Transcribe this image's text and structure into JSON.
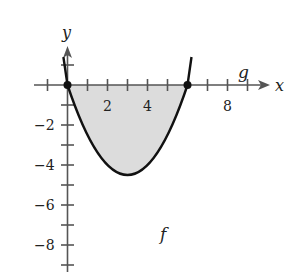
{
  "figure": {
    "axis_labels": {
      "x": "x",
      "y": "y"
    },
    "x_ticks": [
      {
        "value": 2,
        "label": "2"
      },
      {
        "value": 4,
        "label": "4"
      },
      {
        "value": 8,
        "label": "8"
      }
    ],
    "y_ticks": [
      {
        "value": -2,
        "label": "−2"
      },
      {
        "value": -4,
        "label": "−4"
      },
      {
        "value": -6,
        "label": "−6"
      },
      {
        "value": -8,
        "label": "−8"
      }
    ],
    "curve_labels": {
      "f": "f",
      "g": "g"
    },
    "functions": {
      "f": "x^2 - 6x",
      "g": "0"
    },
    "intersection_points": [
      [
        0,
        0
      ],
      [
        6,
        0
      ]
    ],
    "shaded_region": "between f and g from x=0 to x=6",
    "colors": {
      "curve": "#111111",
      "fill": "#d9d9d9",
      "axis": "#555555"
    }
  }
}
